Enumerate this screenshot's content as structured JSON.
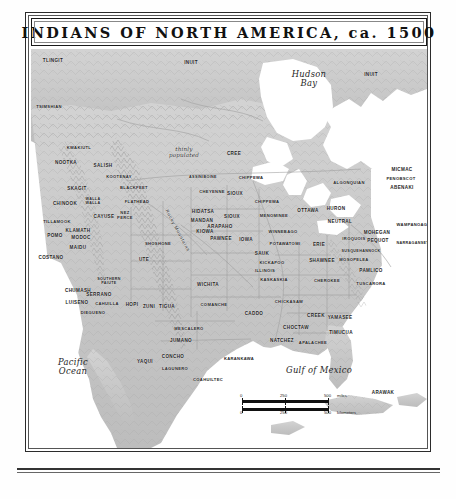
{
  "header": {
    "title": "INDIANS OF NORTH AMERICA, ca. 1500"
  },
  "water_labels": [
    {
      "name": "hudson-bay-label",
      "text": "Hudson\nBay",
      "x": 278,
      "y": 30
    },
    {
      "name": "pacific-ocean-label",
      "text": "Pacific\nOcean",
      "x": 42,
      "y": 318
    },
    {
      "name": "gulf-of-mexico-label",
      "text": "Gulf of Mexico",
      "x": 288,
      "y": 322
    }
  ],
  "annotations": [
    {
      "name": "thinly-populated-note",
      "text": "thinly\npopulated",
      "x": 153,
      "y": 103
    },
    {
      "name": "rocky-mountains-label",
      "text": "Rocky Mountains",
      "x": 146,
      "y": 182
    }
  ],
  "scale_bar": {
    "name": "map-scale-bar",
    "miles": {
      "unit": "miles",
      "ticks": [
        "0",
        "250",
        "500"
      ]
    },
    "kilometers": {
      "unit": "kilometers",
      "ticks": [
        "0",
        "250",
        "500"
      ]
    }
  },
  "tribes": [
    {
      "text": "TLINGIT",
      "x": 22,
      "y": 12
    },
    {
      "text": "INUIT",
      "x": 160,
      "y": 14
    },
    {
      "text": "INUIT",
      "x": 340,
      "y": 26
    },
    {
      "text": "TSIMSHIAN",
      "x": 18,
      "y": 58
    },
    {
      "text": "KWAKIUTL",
      "x": 48,
      "y": 99
    },
    {
      "text": "NOOTKA",
      "x": 35,
      "y": 114
    },
    {
      "text": "SALISH",
      "x": 72,
      "y": 117
    },
    {
      "text": "KOOTENAY",
      "x": 88,
      "y": 128
    },
    {
      "text": "BLACKFEET",
      "x": 103,
      "y": 139
    },
    {
      "text": "SKAGIT",
      "x": 46,
      "y": 140
    },
    {
      "text": "WALLA\nWALLA",
      "x": 62,
      "y": 152
    },
    {
      "text": "CHINOOK",
      "x": 34,
      "y": 155
    },
    {
      "text": "FLATHEAD",
      "x": 106,
      "y": 153
    },
    {
      "text": "CAYUSE",
      "x": 73,
      "y": 168
    },
    {
      "text": "NEZ\nPERCE",
      "x": 94,
      "y": 167
    },
    {
      "text": "TILLAMOOK",
      "x": 26,
      "y": 173
    },
    {
      "text": "KLAMATH",
      "x": 47,
      "y": 182
    },
    {
      "text": "MODOC",
      "x": 50,
      "y": 189
    },
    {
      "text": "POMO",
      "x": 24,
      "y": 187
    },
    {
      "text": "MAIDU",
      "x": 47,
      "y": 199
    },
    {
      "text": "COSTANO",
      "x": 20,
      "y": 209
    },
    {
      "text": "SHOSHONE",
      "x": 127,
      "y": 195
    },
    {
      "text": "CREE",
      "x": 203,
      "y": 105
    },
    {
      "text": "ASSINIBOINE",
      "x": 172,
      "y": 128
    },
    {
      "text": "CHEYENNE",
      "x": 181,
      "y": 143
    },
    {
      "text": "CHIPPEWA",
      "x": 220,
      "y": 129
    },
    {
      "text": "SIOUX",
      "x": 204,
      "y": 145
    },
    {
      "text": "CHIPPEWA",
      "x": 236,
      "y": 153
    },
    {
      "text": "HIDATSA",
      "x": 172,
      "y": 163
    },
    {
      "text": "MANDAN",
      "x": 171,
      "y": 172
    },
    {
      "text": "SIOUX",
      "x": 201,
      "y": 168
    },
    {
      "text": "ARAPAHO",
      "x": 189,
      "y": 178
    },
    {
      "text": "KIOWA",
      "x": 174,
      "y": 183
    },
    {
      "text": "PAWNEE",
      "x": 190,
      "y": 190
    },
    {
      "text": "MENOMINEE",
      "x": 243,
      "y": 167
    },
    {
      "text": "OTTAWA",
      "x": 277,
      "y": 162
    },
    {
      "text": "HURON",
      "x": 305,
      "y": 160
    },
    {
      "text": "NEUTRAL",
      "x": 309,
      "y": 173
    },
    {
      "text": "WINNEBAGO",
      "x": 252,
      "y": 183
    },
    {
      "text": "POTAWATOMI",
      "x": 254,
      "y": 195
    },
    {
      "text": "ERIE",
      "x": 288,
      "y": 196
    },
    {
      "text": "IOWA",
      "x": 215,
      "y": 191
    },
    {
      "text": "SAUK",
      "x": 231,
      "y": 205
    },
    {
      "text": "KICKAPOO",
      "x": 241,
      "y": 214
    },
    {
      "text": "ILLINOIS",
      "x": 234,
      "y": 222
    },
    {
      "text": "KASKASKIA",
      "x": 243,
      "y": 231
    },
    {
      "text": "SHAWNEE",
      "x": 291,
      "y": 212
    },
    {
      "text": "ALGONQUIAN",
      "x": 318,
      "y": 134
    },
    {
      "text": "MICMAC",
      "x": 371,
      "y": 121
    },
    {
      "text": "PENOBSCOT",
      "x": 370,
      "y": 130
    },
    {
      "text": "ABENAKI",
      "x": 371,
      "y": 139
    },
    {
      "text": "MOHEGAN",
      "x": 346,
      "y": 184
    },
    {
      "text": "PEQUOT",
      "x": 347,
      "y": 192
    },
    {
      "text": "WAMPANOAG",
      "x": 381,
      "y": 176
    },
    {
      "text": "NARRAGANSETT",
      "x": 383,
      "y": 194
    },
    {
      "text": "IROQUOIS",
      "x": 323,
      "y": 190
    },
    {
      "text": "SUSQUEHANNOCK",
      "x": 330,
      "y": 202
    },
    {
      "text": "MOSOPELEA",
      "x": 323,
      "y": 211
    },
    {
      "text": "UTE",
      "x": 113,
      "y": 211
    },
    {
      "text": "WICHITA",
      "x": 177,
      "y": 236
    },
    {
      "text": "COMANCHE",
      "x": 183,
      "y": 256
    },
    {
      "text": "SOUTHERN\nPAIUTE",
      "x": 78,
      "y": 232
    },
    {
      "text": "CHUMASH",
      "x": 47,
      "y": 242
    },
    {
      "text": "SERRANO",
      "x": 68,
      "y": 246
    },
    {
      "text": "CAHUILLA",
      "x": 76,
      "y": 255
    },
    {
      "text": "LUISENO",
      "x": 46,
      "y": 254
    },
    {
      "text": "DIEGUENO",
      "x": 62,
      "y": 264
    },
    {
      "text": "HOPI",
      "x": 101,
      "y": 256
    },
    {
      "text": "ZUNI",
      "x": 118,
      "y": 258
    },
    {
      "text": "TIGUA",
      "x": 136,
      "y": 258
    },
    {
      "text": "MESCALERO",
      "x": 158,
      "y": 280
    },
    {
      "text": "CADDO",
      "x": 223,
      "y": 265
    },
    {
      "text": "CHICKASAW",
      "x": 258,
      "y": 253
    },
    {
      "text": "CHEROKEE",
      "x": 296,
      "y": 232
    },
    {
      "text": "PAMLICO",
      "x": 340,
      "y": 222
    },
    {
      "text": "TUSCARORA",
      "x": 340,
      "y": 235
    },
    {
      "text": "CREEK",
      "x": 285,
      "y": 267
    },
    {
      "text": "YAMASEE",
      "x": 309,
      "y": 269
    },
    {
      "text": "CHOCTAW",
      "x": 265,
      "y": 279
    },
    {
      "text": "TIMUCUA",
      "x": 310,
      "y": 284
    },
    {
      "text": "NATCHEZ",
      "x": 251,
      "y": 292
    },
    {
      "text": "APALACHEE",
      "x": 282,
      "y": 294
    },
    {
      "text": "JUMANO",
      "x": 150,
      "y": 292
    },
    {
      "text": "CONCHO",
      "x": 142,
      "y": 308
    },
    {
      "text": "YAQUI",
      "x": 114,
      "y": 313
    },
    {
      "text": "LAGUNERO",
      "x": 144,
      "y": 320
    },
    {
      "text": "KARANKAWA",
      "x": 208,
      "y": 310
    },
    {
      "text": "COAHUILTEC",
      "x": 177,
      "y": 331
    },
    {
      "text": "ARAWAK",
      "x": 352,
      "y": 344
    }
  ],
  "colors": {
    "land": "#c9c9c9",
    "land_shade": "#b0b0b0",
    "water": "#ffffff",
    "border_line": "#8a8a8a",
    "frame": "#2b2b2b",
    "ink": "#1d1d1d"
  }
}
